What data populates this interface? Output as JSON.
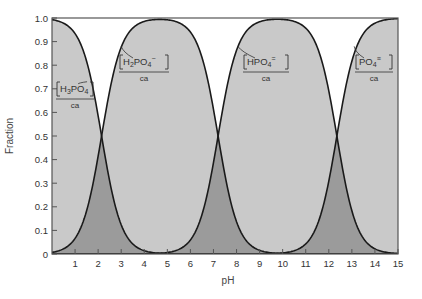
{
  "chart_data": {
    "type": "area",
    "title": "",
    "xlabel": "pH",
    "ylabel": "Fraction",
    "xlim": [
      0,
      15
    ],
    "ylim": [
      0,
      1.0
    ],
    "x_ticks": [
      "1",
      "2",
      "3",
      "4",
      "5",
      "6",
      "7",
      "8",
      "9",
      "10",
      "11",
      "12",
      "13",
      "14",
      "15"
    ],
    "y_ticks": [
      "0",
      "0.1",
      "0.2",
      "0.3",
      "0.4",
      "0.5",
      "0.6",
      "0.7",
      "0.8",
      "0.9",
      "1.0"
    ],
    "grid": false,
    "pKa": [
      2.15,
      7.2,
      12.35
    ],
    "series": [
      {
        "name": "[H3PO4]/ca",
        "label_main": "H",
        "label_sub1": "3",
        "label_rest": "PO",
        "label_sub2": "4",
        "label_charge": "",
        "x": [
          0,
          1,
          1.5,
          2,
          2.15,
          2.5,
          3,
          4,
          5
        ],
        "values": [
          0.99,
          0.93,
          0.82,
          0.59,
          0.5,
          0.31,
          0.12,
          0.01,
          0.0
        ]
      },
      {
        "name": "[H2PO4-]/ca",
        "label_main": "H",
        "label_sub1": "2",
        "label_rest": "PO",
        "label_sub2": "4",
        "label_charge": "−",
        "x": [
          0,
          1,
          2,
          2.15,
          3,
          4,
          4.7,
          6,
          7,
          7.2,
          8,
          9,
          10
        ],
        "values": [
          0.01,
          0.07,
          0.41,
          0.5,
          0.88,
          0.99,
          1.0,
          0.94,
          0.61,
          0.5,
          0.14,
          0.02,
          0.0
        ]
      },
      {
        "name": "[HPO4=]/ca",
        "label_main": "HPO",
        "label_sub1": "",
        "label_rest": "",
        "label_sub2": "4",
        "label_charge": "=",
        "x": [
          5,
          6,
          7,
          7.2,
          8,
          9,
          9.8,
          11,
          12,
          12.35,
          13,
          14,
          15
        ],
        "values": [
          0.01,
          0.06,
          0.39,
          0.5,
          0.86,
          0.98,
          1.0,
          0.96,
          0.69,
          0.5,
          0.18,
          0.02,
          0.0
        ]
      },
      {
        "name": "[PO4≡]/ca",
        "label_main": "PO",
        "label_sub1": "",
        "label_rest": "",
        "label_sub2": "4",
        "label_charge": "≡",
        "x": [
          10,
          11,
          12,
          12.35,
          13,
          14,
          15
        ],
        "values": [
          0.0,
          0.04,
          0.31,
          0.5,
          0.82,
          0.98,
          1.0
        ]
      }
    ],
    "annotations": [
      "[H3PO4]/ca",
      "[H2PO4−]/ca",
      "[HPO4=]/ca",
      "[PO4≡]/ca"
    ],
    "colors": {
      "fill": "#c9c9c9",
      "overlap": "#9b9b9b",
      "line": "#1a1a1a",
      "frame": "#555555"
    }
  },
  "labels": {
    "ca": "ca",
    "xlabel": "pH",
    "ylabel": "Fraction"
  }
}
